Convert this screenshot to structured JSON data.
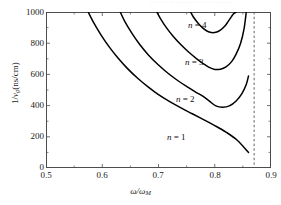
{
  "figure": {
    "top_fragment": "· ·· ·· ·· ··· ·· ·· ··· ·· ·· ·· ·· ··· ·· ···",
    "background": "#ffffff",
    "frame_color": "#4d4d4d",
    "curve_color": "#000000",
    "asymptote_color": "#555555"
  },
  "axes": {
    "x_label_main": "ω/ω",
    "x_label_sub": "M",
    "y_label_pre": "1/",
    "y_label_v": "v",
    "y_label_sub": "g",
    "y_label_post": "(ns/cm)",
    "x_ticks": [
      "0.5",
      "0.6",
      "0.7",
      "0.8",
      "0.9"
    ],
    "y_ticks": [
      "1000",
      "800",
      "600",
      "400",
      "200",
      "0"
    ]
  },
  "curve_labels": [
    {
      "text_n": "n",
      "text_eq": "= 4",
      "full": "n = 4"
    },
    {
      "text_n": "n",
      "text_eq": "= 3",
      "full": "n = 3"
    },
    {
      "text_n": "n",
      "text_eq": "= 2",
      "full": "n = 2"
    },
    {
      "text_n": "n",
      "text_eq": "= 1",
      "full": "n = 1"
    }
  ],
  "chart_data": {
    "type": "line",
    "title": "",
    "xlabel": "ω/ω_M",
    "ylabel": "1/v_g (ns/cm)",
    "xlim": [
      0.5,
      0.9
    ],
    "ylim": [
      0,
      1000
    ],
    "xticks": [
      0.5,
      0.6,
      0.7,
      0.8,
      0.9
    ],
    "yticks": [
      0,
      200,
      400,
      600,
      800,
      1000
    ],
    "grid": false,
    "legend": "inline-annotations",
    "annotations": [
      {
        "label": "n = 4",
        "x": 0.793,
        "y": 935
      },
      {
        "label": "n = 3",
        "x": 0.788,
        "y": 700
      },
      {
        "label": "n = 2",
        "x": 0.772,
        "y": 460
      },
      {
        "label": "n = 1",
        "x": 0.757,
        "y": 215
      }
    ],
    "asymptote": {
      "type": "vertical-dashed",
      "x": 0.87
    },
    "series": [
      {
        "name": "n = 1",
        "x": [
          0.575,
          0.585,
          0.598,
          0.612,
          0.628,
          0.645,
          0.663,
          0.682,
          0.7,
          0.72,
          0.74,
          0.76,
          0.78,
          0.8,
          0.82,
          0.84,
          0.86
        ],
        "y": [
          1000,
          930,
          852,
          778,
          705,
          637,
          575,
          518,
          470,
          425,
          385,
          348,
          310,
          272,
          230,
          178,
          100
        ]
      },
      {
        "name": "n = 2",
        "x": [
          0.632,
          0.64,
          0.652,
          0.666,
          0.682,
          0.7,
          0.718,
          0.736,
          0.752,
          0.766,
          0.778,
          0.79,
          0.802,
          0.814,
          0.826,
          0.838,
          0.848,
          0.856,
          0.86
        ],
        "y": [
          1000,
          940,
          868,
          795,
          725,
          660,
          604,
          556,
          518,
          487,
          462,
          430,
          398,
          390,
          398,
          430,
          475,
          535,
          590
        ]
      },
      {
        "name": "n = 3",
        "x": [
          0.697,
          0.704,
          0.714,
          0.726,
          0.74,
          0.754,
          0.768,
          0.78,
          0.79,
          0.8,
          0.81,
          0.82,
          0.83,
          0.838,
          0.846,
          0.852,
          0.856
        ],
        "y": [
          1000,
          955,
          900,
          845,
          790,
          742,
          700,
          668,
          645,
          632,
          633,
          648,
          682,
          730,
          800,
          890,
          1000
        ]
      },
      {
        "name": "n = 4",
        "x": [
          0.757,
          0.762,
          0.77,
          0.778,
          0.786,
          0.794,
          0.802,
          0.81,
          0.818,
          0.824,
          0.83,
          0.834,
          0.838
        ],
        "y": [
          1000,
          968,
          930,
          900,
          878,
          868,
          870,
          884,
          910,
          940,
          972,
          990,
          1000
        ]
      }
    ]
  }
}
